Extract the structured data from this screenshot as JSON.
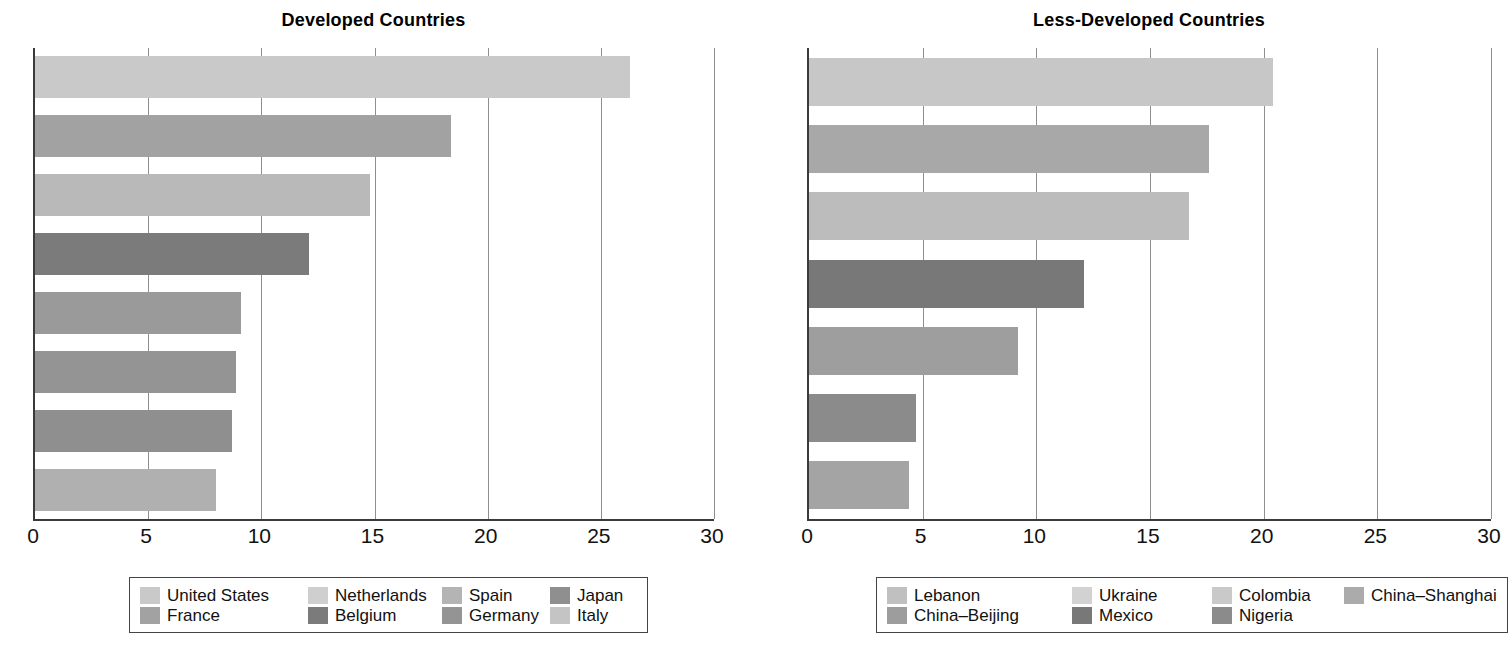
{
  "chart_data": [
    {
      "type": "bar",
      "orientation": "horizontal",
      "title": "Developed Countries",
      "xlabel": "",
      "ylabel": "",
      "xlim": [
        0,
        30
      ],
      "xticks": [
        0,
        5,
        10,
        15,
        20,
        25,
        30
      ],
      "grid": true,
      "legend_position": "bottom",
      "categories": [
        "United States",
        "France",
        "Netherlands",
        "Belgium",
        "Spain",
        "Germany",
        "Japan",
        "Italy"
      ],
      "values": [
        26.3,
        18.4,
        14.8,
        12.1,
        9.1,
        8.9,
        8.7,
        8.0
      ],
      "colors": [
        "#c9c9c9",
        "#a2a2a2",
        "#b9b9b9",
        "#7b7b7b",
        "#9a9a9a",
        "#949494",
        "#8f8f8f",
        "#b0b0b0"
      ],
      "legend_entries": [
        {
          "label": "United States",
          "color": "#c9c9c9"
        },
        {
          "label": "France",
          "color": "#a2a2a2"
        },
        {
          "label": "Netherlands",
          "color": "#cfcfcf"
        },
        {
          "label": "Belgium",
          "color": "#7b7b7b"
        },
        {
          "label": "Spain",
          "color": "#b4b4b4"
        },
        {
          "label": "Germany",
          "color": "#949494"
        },
        {
          "label": "Japan",
          "color": "#8f8f8f"
        },
        {
          "label": "Italy",
          "color": "#c4c4c4"
        }
      ]
    },
    {
      "type": "bar",
      "orientation": "horizontal",
      "title": "Less-Developed Countries",
      "xlabel": "",
      "ylabel": "",
      "xlim": [
        0,
        30
      ],
      "xticks": [
        0,
        5,
        10,
        15,
        20,
        25,
        30
      ],
      "grid": true,
      "legend_position": "bottom",
      "categories": [
        "Lebanon",
        "China–Beijing",
        "Ukraine",
        "Mexico",
        "Colombia",
        "Nigeria",
        "China–Shanghai"
      ],
      "values": [
        20.4,
        17.6,
        16.7,
        12.1,
        9.2,
        4.7,
        4.4
      ],
      "colors": [
        "#c7c7c7",
        "#a8a8a8",
        "#bcbcbc",
        "#787878",
        "#9e9e9e",
        "#8b8b8b",
        "#a4a4a4"
      ],
      "legend_entries": [
        {
          "label": "Lebanon",
          "color": "#c0c0c0"
        },
        {
          "label": "China–Beijing",
          "color": "#9d9d9d"
        },
        {
          "label": "Ukraine",
          "color": "#d2d2d2"
        },
        {
          "label": "Mexico",
          "color": "#787878"
        },
        {
          "label": "Colombia",
          "color": "#c9c9c9"
        },
        {
          "label": "Nigeria",
          "color": "#8b8b8b"
        },
        {
          "label": "China–Shanghai",
          "color": "#ababab"
        }
      ]
    }
  ]
}
